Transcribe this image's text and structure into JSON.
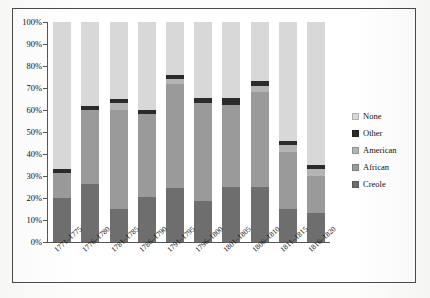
{
  "chart_data": {
    "type": "bar",
    "stacked": true,
    "title": "",
    "xlabel": "",
    "ylabel": "",
    "ylim": [
      0,
      100
    ],
    "y_tick_labels": [
      "100%",
      "90%",
      "80%",
      "70%",
      "60%",
      "50%",
      "40%",
      "30%",
      "20%",
      "10%",
      "0%"
    ],
    "y_tick_values": [
      100,
      90,
      80,
      70,
      60,
      50,
      40,
      30,
      20,
      10,
      0
    ],
    "grid": false,
    "legend_position": "right",
    "categories": [
      "1771–1775",
      "1776–1780",
      "1781–1785",
      "1786–1790",
      "1791–1795",
      "1796–1800",
      "1801–1805",
      "1806–1810",
      "1811–1815",
      "1816–1820"
    ],
    "series": [
      {
        "name": "Creole",
        "color": "#6e6e6e",
        "values": [
          20,
          26.5,
          15,
          20.5,
          24.5,
          18.5,
          25,
          25,
          15,
          13
        ]
      },
      {
        "name": "African",
        "color": "#9a9a9a",
        "values": [
          11.5,
          33.5,
          45,
          37.5,
          47.5,
          44.5,
          37.5,
          43,
          26,
          17
        ]
      },
      {
        "name": "American",
        "color": "#b4b4b4",
        "values": [
          0,
          0,
          3,
          0,
          2,
          0,
          0,
          3,
          3,
          3
        ]
      },
      {
        "name": "Other",
        "color": "#2b2b2b",
        "values": [
          1.5,
          2,
          2,
          2,
          2,
          2.5,
          3,
          2,
          2,
          2
        ]
      },
      {
        "name": "None",
        "color": "#d8d8d8",
        "values": [
          67,
          38,
          35,
          40,
          24,
          34.5,
          34.5,
          27,
          54,
          65
        ]
      }
    ]
  },
  "legend": {
    "items": [
      {
        "label": "None",
        "color": "#d8d8d8"
      },
      {
        "label": "Other",
        "color": "#2b2b2b"
      },
      {
        "label": "American",
        "color": "#b4b4b4"
      },
      {
        "label": "African",
        "color": "#9a9a9a"
      },
      {
        "label": "Creole",
        "color": "#6e6e6e"
      }
    ]
  }
}
